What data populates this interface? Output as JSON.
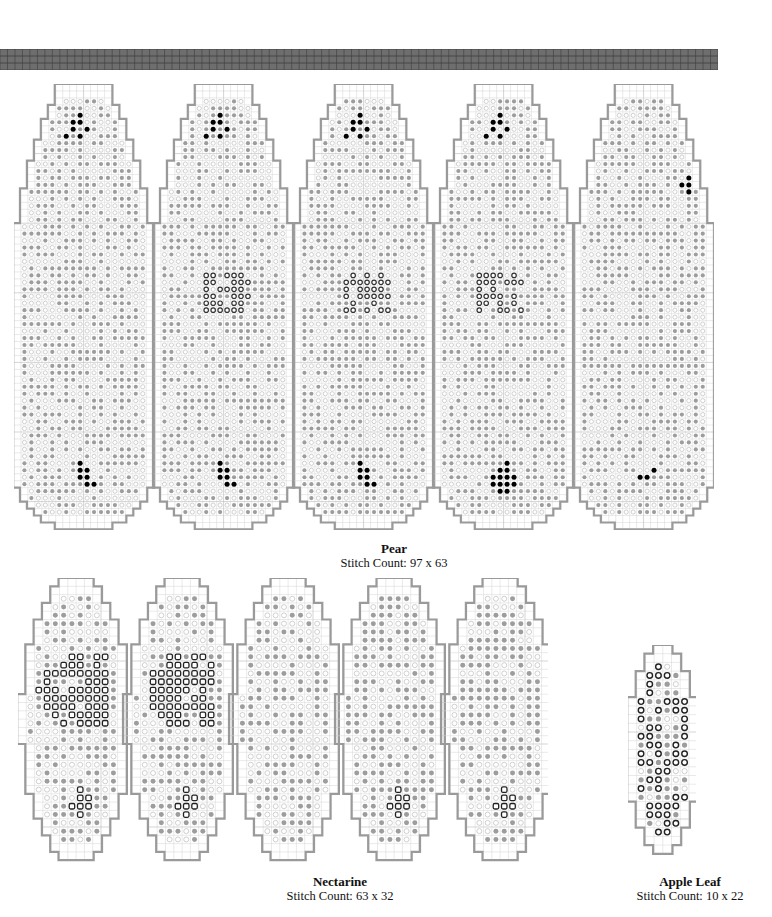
{
  "page": {
    "top_strip": {
      "color": "#6e6e6e",
      "grid_color": "#3e3e3e",
      "cells_x": 96,
      "cells_y": 3
    }
  },
  "colors": {
    "outline": "#9a9a9a",
    "grid": "#d4d4d4",
    "grid_major": "#a8a8a8",
    "symbol_gray": "#9d9d9d",
    "symbol_light": "#c4c4c4",
    "symbol_black": "#000000",
    "symbol_dark_ring": "#222222"
  },
  "charts": [
    {
      "id": "pear",
      "title": "Pear",
      "stitch_count": "Stitch Count: 97 x 63",
      "caption_x": 394,
      "caption_y": 541,
      "box": {
        "x": 14,
        "y": 84,
        "w": 700,
        "h": 446
      },
      "cell": 6.96,
      "panels": 5,
      "panel_shape": "pear",
      "accent_symbol": "filled-dot",
      "ring_symbol": "open-circle"
    },
    {
      "id": "nectarine",
      "title": "Nectarine",
      "stitch_count": "Stitch Count: 63 x 32",
      "caption_x": 340,
      "caption_y": 874,
      "box": {
        "x": 18,
        "y": 578,
        "w": 530,
        "h": 284
      },
      "cell": 8.3,
      "panels": 5,
      "panel_shape": "nectarine",
      "accent_symbol": "open-square"
    },
    {
      "id": "apple-leaf",
      "title": "Apple Leaf",
      "stitch_count": "Stitch Count: 10 x 22",
      "caption_x": 690,
      "caption_y": 874,
      "box": {
        "x": 628,
        "y": 645,
        "w": 68,
        "h": 210
      },
      "cell": 8.7,
      "panels": 1,
      "panel_shape": "leaf",
      "accent_symbol": "open-circle"
    }
  ]
}
